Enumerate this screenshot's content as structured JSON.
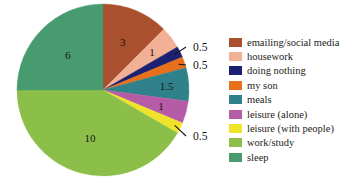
{
  "chart_data": {
    "type": "pie",
    "title": "",
    "subtitle": "",
    "xlabel": "",
    "ylabel": "",
    "legend_position": "right",
    "grid": false,
    "total": 24,
    "units": "hours",
    "start_angle_deg": 0,
    "direction": "clockwise",
    "categories": [
      "emailing/social media",
      "housework",
      "doing nothing",
      "my son",
      "meals",
      "leisure (alone)",
      "leisure (with people)",
      "work/study",
      "sleep"
    ],
    "values": [
      3,
      1,
      0.5,
      0.5,
      1.5,
      1,
      0.5,
      10,
      6
    ],
    "labels": [
      "3",
      "1",
      "0.5",
      "0.5",
      "1.5",
      "1",
      "0.5",
      "10",
      "6"
    ],
    "colors": [
      "#a9502f",
      "#f2b096",
      "#1b2070",
      "#e8701a",
      "#2f8289",
      "#b65ba6",
      "#efe42b",
      "#8cbf4a",
      "#479b6e"
    ],
    "slices": [
      {
        "name": "emailing/social media",
        "value": 3,
        "label": "3",
        "color": "#a9502f",
        "label_placement": "inside"
      },
      {
        "name": "housework",
        "value": 1,
        "label": "1",
        "color": "#f2b096",
        "label_placement": "inside"
      },
      {
        "name": "doing nothing",
        "value": 0.5,
        "label": "0.5",
        "color": "#1b2070",
        "label_placement": "callout"
      },
      {
        "name": "my son",
        "value": 0.5,
        "label": "0.5",
        "color": "#e8701a",
        "label_placement": "callout"
      },
      {
        "name": "meals",
        "value": 1.5,
        "label": "1.5",
        "color": "#2f8289",
        "label_placement": "inside"
      },
      {
        "name": "leisure (alone)",
        "value": 1,
        "label": "1",
        "color": "#b65ba6",
        "label_placement": "inside"
      },
      {
        "name": "leisure (with people)",
        "value": 0.5,
        "label": "0.5",
        "color": "#efe42b",
        "label_placement": "callout"
      },
      {
        "name": "work/study",
        "value": 10,
        "label": "10",
        "color": "#8cbf4a",
        "label_placement": "inside"
      },
      {
        "name": "sleep",
        "value": 6,
        "label": "6",
        "color": "#479b6e",
        "label_placement": "inside"
      }
    ]
  },
  "legend": {
    "items": [
      {
        "label": "emailing/social media",
        "color": "#a9502f"
      },
      {
        "label": "housework",
        "color": "#f2b096"
      },
      {
        "label": "doing nothing",
        "color": "#1b2070"
      },
      {
        "label": "my son",
        "color": "#e8701a"
      },
      {
        "label": "meals",
        "color": "#2f8289"
      },
      {
        "label": "leisure (alone)",
        "color": "#b65ba6"
      },
      {
        "label": "leisure (with people)",
        "color": "#efe42b"
      },
      {
        "label": "work/study",
        "color": "#8cbf4a"
      },
      {
        "label": "sleep",
        "color": "#479b6e"
      }
    ]
  }
}
